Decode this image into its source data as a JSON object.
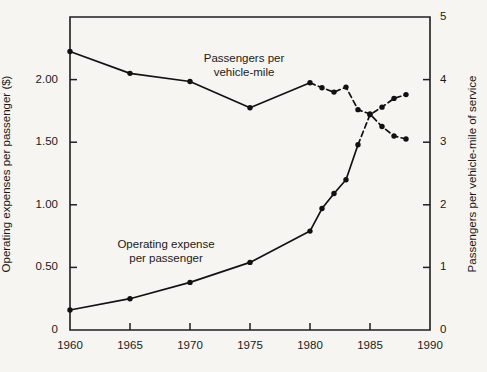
{
  "chart_data": {
    "type": "line",
    "title": "",
    "subtitle": "",
    "xlabel": "",
    "ylabel": "Operating expenses per passenger ($)",
    "y2label": "Passengers per vehicle-mile of service",
    "xlim": [
      1960,
      1990
    ],
    "ylim": [
      0,
      2.5
    ],
    "y2lim": [
      0,
      5
    ],
    "grid": false,
    "legend_position": "inline-annotation",
    "x_ticks": [
      1960,
      1965,
      1970,
      1975,
      1980,
      1985,
      1990
    ],
    "x_tick_labels": [
      "1960",
      "1965",
      "1970",
      "1975",
      "1980",
      "1985",
      "1990"
    ],
    "y_ticks": [
      0,
      0.5,
      1.0,
      1.5,
      2.0,
      2.5
    ],
    "y_tick_labels": [
      "0",
      "0.50",
      "1.00",
      "1.50",
      "2.00",
      ""
    ],
    "y2_ticks": [
      0,
      1,
      2,
      3,
      4,
      5
    ],
    "y2_tick_labels": [
      "0",
      "1",
      "2",
      "3",
      "4",
      "5"
    ],
    "annotations": [
      {
        "text_line1": "Passengers per",
        "text_line2": "vehicle-mile",
        "x": 1977.0,
        "y_axis": "right"
      },
      {
        "text_line1": "Operating expense",
        "text_line2": "per passenger",
        "x": 1970.5,
        "y_axis": "left"
      }
    ],
    "series": [
      {
        "name": "Operating expense per passenger",
        "axis": "left",
        "units": "dollars per passenger",
        "line_style_solid_until": 1984,
        "x": [
          1960,
          1965,
          1970,
          1975,
          1980,
          1981,
          1982,
          1983,
          1984,
          1985,
          1986,
          1987,
          1988
        ],
        "values": [
          0.16,
          0.25,
          0.38,
          0.54,
          0.79,
          0.97,
          1.09,
          1.2,
          1.48,
          1.72,
          1.78,
          1.85,
          1.88
        ]
      },
      {
        "name": "Passengers per vehicle-mile",
        "axis": "right",
        "units": "passengers per vehicle-mile of service",
        "line_style_solid_until": 1980,
        "x": [
          1960,
          1965,
          1970,
          1975,
          1980,
          1981,
          1982,
          1983,
          1984,
          1985,
          1986,
          1987,
          1988
        ],
        "values": [
          4.45,
          4.1,
          3.97,
          3.55,
          3.95,
          3.87,
          3.8,
          3.88,
          3.52,
          3.45,
          3.25,
          3.1,
          3.05
        ]
      }
    ]
  },
  "style": {
    "background": "#f7f5f1",
    "ink": "#1a1a1a",
    "line_color": "#121212"
  }
}
